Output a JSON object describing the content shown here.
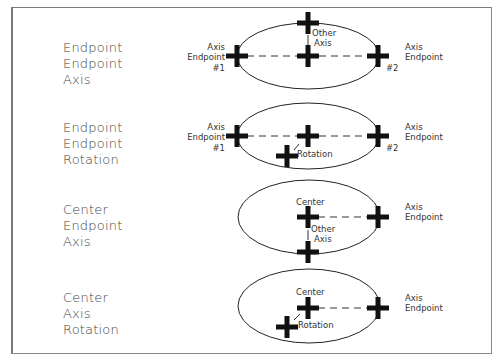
{
  "diagram": {
    "rows": [
      {
        "method": [
          "Endpoint",
          "Endpoint",
          "Axis"
        ],
        "labels": {
          "left_line1": "Axis",
          "left_line2": "Endpoint",
          "left_num": "#1",
          "right_line1": "Axis",
          "right_line2": "Endpoint",
          "right_num": "#2",
          "other_line1": "Other",
          "other_line2": "Axis"
        }
      },
      {
        "method": [
          "Endpoint",
          "Endpoint",
          "Rotation"
        ],
        "labels": {
          "left_line1": "Axis",
          "left_line2": "Endpoint",
          "left_num": "#1",
          "right_line1": "Axis",
          "right_line2": "Endpoint",
          "right_num": "#2",
          "rotation": "Rotation"
        }
      },
      {
        "method": [
          "Center",
          "Endpoint",
          "Axis"
        ],
        "labels": {
          "center": "Center",
          "right_line1": "Axis",
          "right_line2": "Endpoint",
          "other_line1": "Other",
          "other_line2": "Axis"
        }
      },
      {
        "method": [
          "Center",
          "Axis",
          "Rotation"
        ],
        "labels": {
          "center": "Center",
          "right_line1": "Axis",
          "right_line2": "Endpoint",
          "rotation": "Rotation"
        }
      }
    ],
    "colors": {
      "stroke": "#222222",
      "marker": "#111111",
      "frame": "#7a7a7a"
    }
  }
}
